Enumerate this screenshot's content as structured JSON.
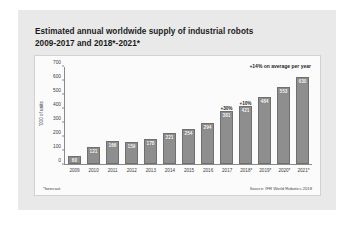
{
  "title": {
    "line1": "Estimated annual worldwide supply of industrial robots",
    "line2": "2009-2017 and 2018*-2021*"
  },
  "footnote": "*forecast",
  "source": "Source: IFR World Robotics 2018",
  "annotation_avg": "+14% on average per year",
  "chart_data": {
    "type": "bar",
    "title": "Estimated annual worldwide supply of industrial robots 2009-2017 and 2018*-2021*",
    "xlabel": "",
    "ylabel": "'000 of units",
    "ylim": [
      0,
      700
    ],
    "yticks": [
      "0",
      "100",
      "200",
      "300",
      "400",
      "500",
      "600",
      "700"
    ],
    "grid": false,
    "legend": "none",
    "categories": [
      "2009",
      "2010",
      "2011",
      "2012",
      "2013",
      "2014",
      "2015",
      "2016",
      "2017",
      "2018*",
      "2019*",
      "2020*",
      "2021*"
    ],
    "values": [
      60,
      121,
      166,
      159,
      178,
      221,
      254,
      294,
      381,
      421,
      484,
      553,
      630
    ],
    "point_labels": [
      "60",
      "121",
      "166",
      "159",
      "178",
      "221",
      "254",
      "294",
      "381",
      "421",
      "484",
      "553",
      "630"
    ],
    "forecast_flags": [
      false,
      false,
      false,
      false,
      false,
      false,
      false,
      false,
      false,
      true,
      true,
      true,
      true
    ],
    "growth_labels": [
      "",
      "",
      "",
      "",
      "",
      "",
      "",
      "",
      "+30%",
      "+10%",
      "",
      "",
      ""
    ],
    "annotations": [
      "+14% on average per year"
    ]
  }
}
